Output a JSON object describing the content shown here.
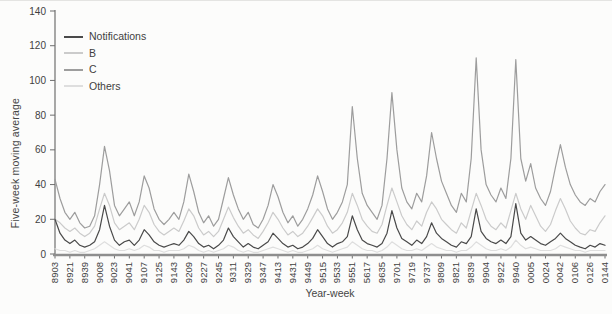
{
  "figure": {
    "background": "#fcfcfb",
    "axis_color": "#6f6f6f",
    "text_color": "#3f3f3f"
  },
  "chart_data": {
    "type": "line",
    "title": "",
    "xlabel": "Year-week",
    "ylabel": "Five-week moving average",
    "ylim": [
      0,
      140
    ],
    "yticks": [
      0,
      20,
      40,
      60,
      80,
      100,
      120,
      140
    ],
    "grid": false,
    "legend_position": "top-left-inside",
    "x_tick_labels": [
      "8903",
      "8921",
      "8939",
      "9008",
      "9023",
      "9041",
      "9107",
      "9125",
      "9143",
      "9209",
      "9227",
      "9245",
      "9311",
      "9329",
      "9347",
      "9413",
      "9431",
      "9449",
      "9515",
      "9533",
      "9551",
      "5617",
      "9635",
      "9701",
      "9719",
      "9737",
      "9809",
      "9821",
      "9839",
      "9904",
      "9922",
      "9940",
      "0005",
      "0024",
      "0042",
      "0106",
      "0126",
      "0144"
    ],
    "series": [
      {
        "name": "Notifications",
        "color": "#4a4a4a",
        "values": [
          20,
          12,
          8,
          6,
          8,
          5,
          4,
          5,
          7,
          14,
          28,
          16,
          8,
          5,
          7,
          8,
          5,
          8,
          14,
          11,
          7,
          5,
          4,
          5,
          6,
          5,
          8,
          13,
          10,
          6,
          4,
          5,
          3,
          5,
          8,
          15,
          10,
          7,
          4,
          6,
          4,
          3,
          5,
          7,
          12,
          9,
          6,
          4,
          5,
          3,
          4,
          6,
          9,
          14,
          10,
          6,
          4,
          6,
          7,
          10,
          22,
          14,
          8,
          6,
          5,
          4,
          6,
          12,
          25,
          15,
          9,
          7,
          5,
          8,
          6,
          10,
          18,
          12,
          9,
          7,
          5,
          4,
          7,
          6,
          10,
          26,
          13,
          9,
          7,
          6,
          8,
          6,
          10,
          29,
          12,
          8,
          10,
          8,
          6,
          5,
          7,
          9,
          12,
          9,
          7,
          5,
          4,
          3,
          5,
          4,
          6,
          5
        ]
      },
      {
        "name": "B",
        "color": "#cbcbcb",
        "values": [
          20,
          18,
          15,
          13,
          15,
          12,
          10,
          12,
          16,
          26,
          35,
          28,
          18,
          14,
          16,
          18,
          14,
          20,
          28,
          24,
          17,
          13,
          11,
          13,
          15,
          13,
          19,
          26,
          22,
          15,
          11,
          13,
          10,
          13,
          20,
          27,
          21,
          16,
          12,
          14,
          11,
          9,
          13,
          18,
          24,
          20,
          15,
          11,
          13,
          10,
          12,
          16,
          21,
          26,
          22,
          16,
          12,
          14,
          18,
          24,
          35,
          28,
          20,
          16,
          13,
          12,
          17,
          28,
          38,
          30,
          22,
          17,
          14,
          19,
          16,
          24,
          30,
          26,
          20,
          17,
          14,
          12,
          18,
          15,
          25,
          35,
          28,
          20,
          16,
          14,
          18,
          15,
          25,
          35,
          26,
          20,
          28,
          22,
          16,
          13,
          17,
          25,
          32,
          26,
          19,
          15,
          12,
          11,
          14,
          13,
          18,
          22
        ]
      },
      {
        "name": "C",
        "color": "#9d9d9d",
        "values": [
          43,
          32,
          24,
          20,
          24,
          18,
          15,
          16,
          22,
          40,
          62,
          48,
          28,
          22,
          26,
          30,
          22,
          30,
          45,
          38,
          26,
          20,
          17,
          20,
          24,
          20,
          30,
          46,
          36,
          24,
          18,
          22,
          16,
          20,
          32,
          44,
          34,
          26,
          20,
          24,
          17,
          15,
          20,
          28,
          40,
          33,
          24,
          18,
          22,
          16,
          20,
          26,
          34,
          45,
          36,
          26,
          20,
          24,
          30,
          40,
          85,
          55,
          35,
          28,
          24,
          20,
          28,
          55,
          93,
          60,
          38,
          30,
          26,
          35,
          30,
          45,
          70,
          55,
          42,
          35,
          28,
          24,
          35,
          30,
          55,
          113,
          60,
          40,
          34,
          30,
          38,
          32,
          55,
          112,
          55,
          42,
          52,
          38,
          32,
          28,
          36,
          50,
          63,
          50,
          40,
          34,
          30,
          28,
          32,
          30,
          36,
          40
        ]
      },
      {
        "name": "Others",
        "color": "#dedede",
        "values": [
          3,
          2,
          2,
          1,
          2,
          1,
          1,
          2,
          3,
          5,
          7,
          5,
          3,
          2,
          2,
          3,
          2,
          3,
          5,
          4,
          2,
          2,
          1,
          2,
          2,
          2,
          3,
          5,
          4,
          2,
          1,
          2,
          1,
          2,
          3,
          5,
          4,
          2,
          1,
          2,
          1,
          1,
          2,
          3,
          4,
          3,
          2,
          1,
          2,
          1,
          1,
          2,
          3,
          5,
          3,
          2,
          1,
          2,
          3,
          4,
          7,
          5,
          3,
          2,
          2,
          1,
          2,
          4,
          7,
          5,
          3,
          2,
          2,
          3,
          2,
          4,
          6,
          4,
          3,
          2,
          2,
          1,
          2,
          2,
          4,
          7,
          5,
          3,
          2,
          2,
          3,
          2,
          4,
          8,
          5,
          3,
          4,
          3,
          2,
          2,
          2,
          3,
          5,
          4,
          3,
          2,
          2,
          1,
          2,
          2,
          2,
          2
        ]
      }
    ]
  }
}
